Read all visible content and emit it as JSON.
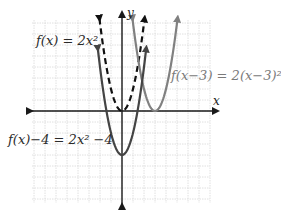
{
  "chart_data": {
    "type": "line",
    "title": "",
    "xlabel": "x",
    "ylabel": "y",
    "grid": true,
    "xlim": [
      -8,
      8
    ],
    "ylim": [
      -9,
      9
    ],
    "unit_px": 11,
    "series": [
      {
        "name": "f(x) = 2x^2",
        "label": "f(x) = 2x²",
        "style": "dashed",
        "color": "#111111",
        "formula": "2*x^2",
        "x_range": [
          -2.05,
          2.05
        ],
        "vertex": [
          0,
          0
        ]
      },
      {
        "name": "f(x-3) = 2(x-3)^2",
        "label": "f(x−3) = 2(x−3)²",
        "style": "solid",
        "color": "#808080",
        "formula": "2*(x-3)^2",
        "x_range": [
          0.95,
          5.05
        ],
        "vertex": [
          3,
          0
        ]
      },
      {
        "name": "f(x)-4 = 2x^2-4",
        "label": "f(x)−4 = 2x² −4",
        "style": "solid",
        "color": "#444444",
        "formula": "2*x^2-4",
        "x_range": [
          -2.2,
          2.2
        ],
        "vertex": [
          0,
          -4
        ]
      }
    ],
    "annotations": [
      {
        "text": "f(x) = 2x²",
        "near": "dashed parabola, upper left"
      },
      {
        "text": "f(x−3) = 2(x−3)²",
        "near": "gray parabola, right"
      },
      {
        "text": "f(x)−4 = 2x² −4",
        "near": "dark parabola, lower left"
      }
    ]
  },
  "labels": {
    "f": "f(x) = 2x²",
    "shift": "f(x−3) = 2(x−3)²",
    "down": "f(x)−4 = 2x² −4",
    "x_axis": "x",
    "y_axis": "y"
  },
  "colors": {
    "grid": "#d8d8d8",
    "axis": "#1a1a1a",
    "dashed": "#111111",
    "shifted": "#808080",
    "down": "#444444"
  }
}
